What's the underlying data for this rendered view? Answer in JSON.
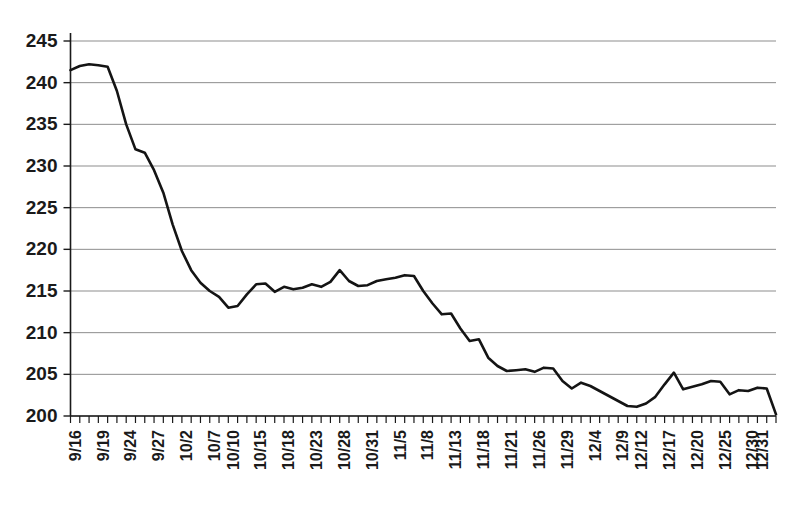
{
  "chart_data": {
    "type": "line",
    "title": "",
    "subtitle": "",
    "xlabel": "",
    "ylabel": "",
    "ylim": [
      200,
      245
    ],
    "ytick_step": 5,
    "ytick_labels": [
      "245",
      "240",
      "235",
      "230",
      "225",
      "220",
      "215",
      "210",
      "205",
      "200"
    ],
    "ytick_values": [
      245,
      240,
      235,
      230,
      225,
      220,
      215,
      210,
      205,
      200
    ],
    "grid": true,
    "grid_axis": "y",
    "legend": false,
    "legend_position": "none",
    "line_color": "#141414",
    "grid_color": "#8d8d8d",
    "axis_color": "#1a1a1a",
    "background_color": "#ffffff",
    "xtick_labels": [
      "9/16",
      "9/19",
      "9/24",
      "9/27",
      "10/2",
      "10/7",
      "10/10",
      "10/15",
      "10/18",
      "10/23",
      "10/28",
      "10/31",
      "11/5",
      "11/8",
      "11/13",
      "11/18",
      "11/21",
      "11/26",
      "11/29",
      "12/4",
      "12/9",
      "12/12",
      "12/17",
      "12/20",
      "12/25",
      "12/30",
      "12/31"
    ],
    "xtick_label_indices": [
      0,
      3,
      6,
      9,
      12,
      15,
      17,
      20,
      23,
      26,
      29,
      32,
      35,
      38,
      41,
      44,
      47,
      50,
      53,
      56,
      59,
      61,
      64,
      67,
      70,
      73,
      74
    ],
    "x": [
      "9/16",
      "9/17",
      "9/18",
      "9/19",
      "9/22",
      "9/23",
      "9/24",
      "9/25",
      "9/26",
      "9/27",
      "9/30",
      "10/1",
      "10/2",
      "10/3",
      "10/6",
      "10/7",
      "10/8",
      "10/9",
      "10/10",
      "10/13",
      "10/14",
      "10/15",
      "10/16",
      "10/17",
      "10/18",
      "10/21",
      "10/22",
      "10/23",
      "10/24",
      "10/27",
      "10/28",
      "10/29",
      "10/30",
      "10/31",
      "11/3",
      "11/4",
      "11/5",
      "11/6",
      "11/7",
      "11/8",
      "11/11",
      "11/12",
      "11/13",
      "11/14",
      "11/17",
      "11/18",
      "11/19",
      "11/20",
      "11/21",
      "11/24",
      "11/25",
      "11/26",
      "11/27",
      "11/28",
      "11/29",
      "12/1",
      "12/2",
      "12/3",
      "12/4",
      "12/5",
      "12/8",
      "12/9",
      "12/10",
      "12/11",
      "12/12",
      "12/15",
      "12/16",
      "12/17",
      "12/18",
      "12/19",
      "12/22",
      "12/23",
      "12/24",
      "12/26",
      "12/29",
      "12/30",
      "12/31"
    ],
    "values": [
      241.5,
      242.0,
      242.2,
      242.1,
      241.9,
      239.0,
      235.0,
      232.0,
      231.6,
      229.5,
      226.8,
      223.0,
      219.8,
      217.5,
      216.0,
      215.0,
      214.3,
      213.0,
      213.2,
      214.6,
      215.8,
      215.9,
      214.9,
      215.5,
      215.2,
      215.4,
      215.8,
      215.5,
      216.1,
      217.5,
      216.2,
      215.6,
      215.7,
      216.2,
      216.4,
      216.6,
      216.9,
      216.8,
      215.0,
      213.5,
      212.2,
      212.3,
      210.5,
      209.0,
      209.2,
      207.0,
      206.0,
      205.4,
      205.5,
      205.6,
      205.3,
      205.8,
      205.7,
      204.2,
      203.3,
      204.0,
      203.6,
      203.0,
      202.4,
      201.8,
      201.2,
      201.1,
      201.5,
      202.3,
      203.8,
      205.2,
      203.2,
      203.5,
      203.8,
      204.2,
      204.1,
      202.6,
      203.1,
      203.0,
      203.4,
      203.3,
      200.2
    ]
  }
}
